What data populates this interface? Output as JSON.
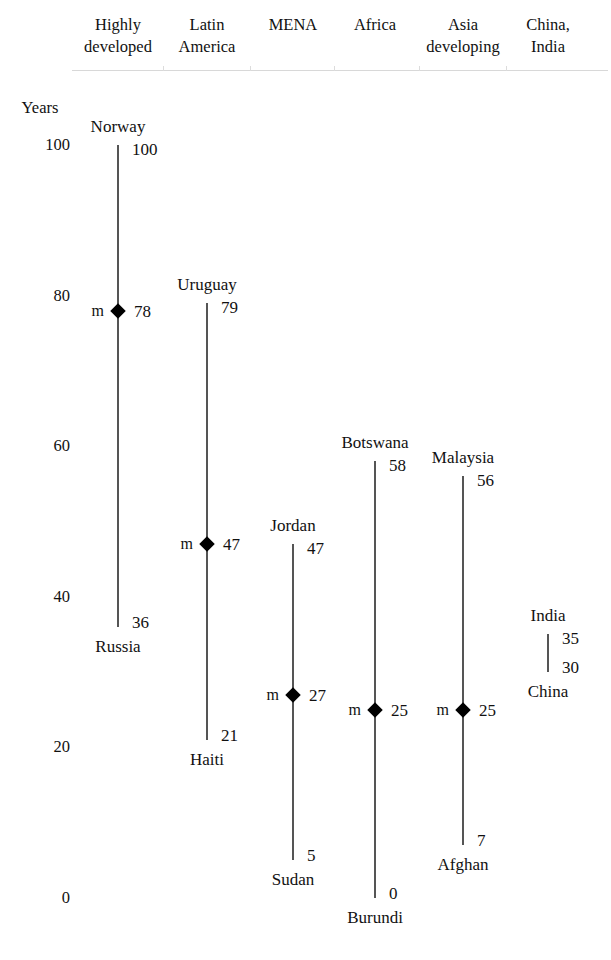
{
  "chart_data": {
    "type": "range",
    "title": "",
    "ylabel": "Years",
    "ylim": [
      0,
      100
    ],
    "yticks": [
      100,
      80,
      60,
      40,
      20,
      0
    ],
    "grid": false,
    "legend": "none",
    "median_marker_letter": "m",
    "categories": [
      "Highly developed",
      "Latin America",
      "MENA",
      "Africa",
      "Asia developing",
      "China, India"
    ],
    "series": [
      {
        "name": "Highly developed",
        "header": "Highly\ndeveloped",
        "max": 100,
        "max_label": "100",
        "max_country": "Norway",
        "median": 78,
        "median_label": "78",
        "min": 36,
        "min_label": "36",
        "min_country": "Russia",
        "has_median_marker": true
      },
      {
        "name": "Latin America",
        "header": "Latin\nAmerica",
        "max": 79,
        "max_label": "79",
        "max_country": "Uruguay",
        "median": 47,
        "median_label": "47",
        "min": 21,
        "min_label": "21",
        "min_country": "Haiti",
        "has_median_marker": true
      },
      {
        "name": "MENA",
        "header": "MENA",
        "max": 47,
        "max_label": "47",
        "max_country": "Jordan",
        "median": 27,
        "median_label": "27",
        "min": 5,
        "min_label": "5",
        "min_country": "Sudan",
        "has_median_marker": true
      },
      {
        "name": "Africa",
        "header": "Africa",
        "max": 58,
        "max_label": "58",
        "max_country": "Botswana",
        "median": 25,
        "median_label": "25",
        "min": 0,
        "min_label": "0",
        "min_country": "Burundi",
        "has_median_marker": true
      },
      {
        "name": "Asia developing",
        "header": "Asia\ndeveloping",
        "max": 56,
        "max_label": "56",
        "max_country": "Malaysia",
        "median": 25,
        "median_label": "25",
        "min": 7,
        "min_label": "7",
        "min_country": "Afghan",
        "has_median_marker": true
      },
      {
        "name": "China, India",
        "header": "China,\nIndia",
        "max": 35,
        "max_label": "35",
        "max_country": "India",
        "median": null,
        "median_label": "",
        "min": 30,
        "min_label": "30",
        "min_country": "China",
        "has_median_marker": false
      }
    ]
  },
  "axis": {
    "title": "Years",
    "tick_labels": [
      "100",
      "80",
      "60",
      "40",
      "20",
      "0"
    ]
  },
  "colors": {
    "line": "#555555",
    "marker": "#000000",
    "text": "#111111",
    "rule": "#d8d8d8",
    "background": "#ffffff"
  }
}
